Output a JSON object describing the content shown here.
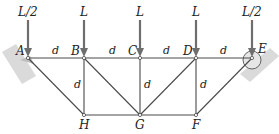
{
  "diagram": {
    "type": "truss",
    "colors": {
      "member": "#4a4a4a",
      "load_arrow": "#6e6e6e",
      "support": "#a0a0a0",
      "support_fill": "#d4d4d4"
    },
    "nodes": {
      "A": {
        "label": "A",
        "x": 28,
        "y": 58
      },
      "B": {
        "label": "B",
        "x": 84,
        "y": 58
      },
      "C": {
        "label": "C",
        "x": 140,
        "y": 58
      },
      "D": {
        "label": "D",
        "x": 196,
        "y": 58
      },
      "E": {
        "label": "E",
        "x": 252,
        "y": 58
      },
      "H": {
        "label": "H",
        "x": 84,
        "y": 115
      },
      "G": {
        "label": "G",
        "x": 140,
        "y": 115
      },
      "F": {
        "label": "F",
        "x": 196,
        "y": 115
      }
    },
    "members": [
      [
        "A",
        "B"
      ],
      [
        "B",
        "C"
      ],
      [
        "C",
        "D"
      ],
      [
        "D",
        "E"
      ],
      [
        "H",
        "G"
      ],
      [
        "G",
        "F"
      ],
      [
        "B",
        "H"
      ],
      [
        "C",
        "G"
      ],
      [
        "D",
        "F"
      ],
      [
        "A",
        "H"
      ],
      [
        "B",
        "G"
      ],
      [
        "D",
        "G"
      ],
      [
        "E",
        "F"
      ]
    ],
    "loads": [
      {
        "at": "A",
        "label": "L/2"
      },
      {
        "at": "B",
        "label": "L"
      },
      {
        "at": "C",
        "label": "L"
      },
      {
        "at": "D",
        "label": "L"
      },
      {
        "at": "E",
        "label": "L/2"
      }
    ],
    "dimension_labels": {
      "AB": "d",
      "BC": "d",
      "CD": "d",
      "DE": "d",
      "BH": "d",
      "CG": "d",
      "DF": "d"
    },
    "supports": {
      "A": "pin",
      "E": "roller"
    }
  }
}
